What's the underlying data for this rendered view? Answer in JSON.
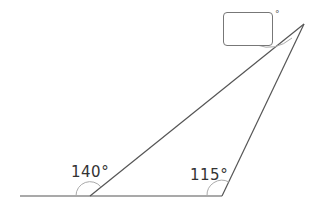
{
  "diagram": {
    "type": "triangle-exterior-angles",
    "labels": {
      "left_exterior_angle": "140°",
      "right_exterior_angle": "115°",
      "top_angle_unknown": "",
      "top_degree_symbol": "°"
    },
    "colors": {
      "line": "#444444",
      "arc": "#999999",
      "text": "#333333"
    }
  }
}
